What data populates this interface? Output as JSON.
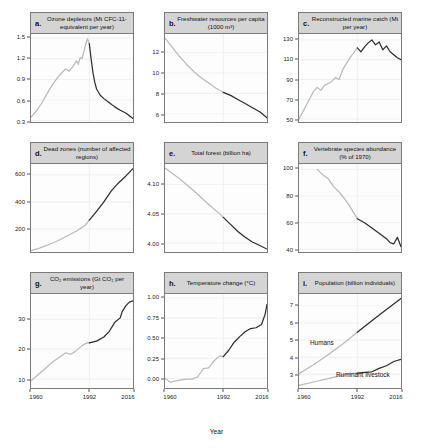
{
  "figure": {
    "xlabel": "Year",
    "xticks": [
      "1960",
      "1992",
      "2016"
    ],
    "colors": {
      "early": "#b9b9b9",
      "late": "#2b2b2b",
      "strip": "#d4d4d4",
      "grid": "#ececec"
    }
  },
  "chart_data": [
    {
      "type": "line",
      "letter": "a.",
      "title": "Ozone depletors (Mt CFC-11-equivalent per year)",
      "xlabel": "Year",
      "ylabel": "",
      "xlim": [
        1960,
        2016
      ],
      "ylim": [
        0.28,
        1.56
      ],
      "yticks": [
        1.5,
        1.2,
        0.9,
        0.6,
        0.3
      ],
      "ytick_labels": [
        "1.5",
        "1.2",
        "0.9",
        "0.6",
        "0.3"
      ],
      "grid": true,
      "legend": "none",
      "split_year": 1992,
      "series": [
        {
          "name": "Ozone depletors",
          "x": [
            1960,
            1963,
            1966,
            1969,
            1972,
            1975,
            1977,
            1979,
            1981,
            1983,
            1985,
            1986,
            1987,
            1988,
            1989,
            1990,
            1991,
            1992,
            1993,
            1994,
            1995,
            1996,
            1998,
            2000,
            2003,
            2006,
            2009,
            2012,
            2014,
            2016
          ],
          "values": [
            0.35,
            0.44,
            0.56,
            0.7,
            0.83,
            0.94,
            1.0,
            1.05,
            1.02,
            1.09,
            1.17,
            1.12,
            1.22,
            1.2,
            1.3,
            1.41,
            1.49,
            1.42,
            1.2,
            1.0,
            0.86,
            0.76,
            0.67,
            0.62,
            0.56,
            0.5,
            0.45,
            0.41,
            0.37,
            0.33
          ]
        }
      ]
    },
    {
      "type": "line",
      "letter": "b.",
      "title": "Freshwater resources per capita (1000 m³)",
      "xlabel": "Year",
      "ylabel": "",
      "xlim": [
        1960,
        2016
      ],
      "ylim": [
        5.2,
        13.8
      ],
      "yticks": [
        12,
        10,
        8,
        6
      ],
      "ytick_labels": [
        "12",
        "10",
        "8",
        "6"
      ],
      "grid": true,
      "legend": "none",
      "split_year": 1992,
      "series": [
        {
          "name": "Freshwater per capita",
          "x": [
            1960,
            1964,
            1968,
            1972,
            1976,
            1980,
            1984,
            1988,
            1992,
            1996,
            2000,
            2004,
            2008,
            2012,
            2016
          ],
          "values": [
            13.4,
            12.5,
            11.6,
            10.8,
            10.1,
            9.5,
            9.0,
            8.5,
            8.1,
            7.8,
            7.4,
            7.0,
            6.6,
            6.2,
            5.6
          ]
        }
      ]
    },
    {
      "type": "line",
      "letter": "c.",
      "title": "Reconstructed marine catch (Mt per year)",
      "xlabel": "Year",
      "ylabel": "",
      "xlim": [
        1960,
        2016
      ],
      "ylim": [
        47,
        136
      ],
      "yticks": [
        130,
        110,
        90,
        70,
        50
      ],
      "ytick_labels": [
        "130",
        "110",
        "90",
        "70",
        "50"
      ],
      "grid": true,
      "legend": "none",
      "split_year": 1992,
      "series": [
        {
          "name": "Marine catch",
          "x": [
            1960,
            1962,
            1964,
            1966,
            1968,
            1970,
            1972,
            1974,
            1976,
            1978,
            1980,
            1982,
            1984,
            1986,
            1988,
            1990,
            1992,
            1994,
            1996,
            1998,
            2000,
            2002,
            2004,
            2006,
            2008,
            2010,
            2012,
            2014,
            2016
          ],
          "values": [
            50,
            57,
            64,
            71,
            78,
            82,
            79,
            84,
            86,
            88,
            92,
            90,
            100,
            106,
            112,
            117,
            122,
            118,
            123,
            127,
            130,
            125,
            128,
            120,
            124,
            118,
            115,
            112,
            110
          ]
        }
      ]
    },
    {
      "type": "line",
      "letter": "d.",
      "title": "Dead zones (number of affected regions)",
      "xlabel": "Year",
      "ylabel": "",
      "xlim": [
        1960,
        2016
      ],
      "ylim": [
        30,
        680
      ],
      "yticks": [
        600,
        400,
        200
      ],
      "ytick_labels": [
        "600",
        "400",
        "200"
      ],
      "grid": true,
      "legend": "none",
      "split_year": 1992,
      "series": [
        {
          "name": "Dead zones",
          "x": [
            1960,
            1965,
            1970,
            1975,
            1980,
            1985,
            1990,
            1992,
            1996,
            2000,
            2004,
            2008,
            2012,
            2016
          ],
          "values": [
            40,
            60,
            85,
            115,
            150,
            185,
            230,
            265,
            330,
            400,
            480,
            540,
            590,
            645
          ]
        }
      ]
    },
    {
      "type": "line",
      "letter": "e.",
      "title": "Total forest (billion ha)",
      "xlabel": "Year",
      "ylabel": "",
      "xlim": [
        1960,
        2016
      ],
      "ylim": [
        3.985,
        4.135
      ],
      "yticks": [
        4.1,
        4.05,
        4.0
      ],
      "ytick_labels": [
        "4.10",
        "4.05",
        "4.00"
      ],
      "grid": true,
      "legend": "none",
      "split_year": 1992,
      "series": [
        {
          "name": "Total forest",
          "x": [
            1960,
            1968,
            1976,
            1984,
            1990,
            1992,
            1996,
            2000,
            2004,
            2008,
            2012,
            2016
          ],
          "values": [
            4.128,
            4.11,
            4.089,
            4.066,
            4.05,
            4.044,
            4.032,
            4.02,
            4.01,
            4.002,
            3.996,
            3.99
          ]
        }
      ]
    },
    {
      "type": "line",
      "letter": "f.",
      "title": "Vertebrate species abundance (% of 1970)",
      "xlabel": "Year",
      "ylabel": "",
      "xlim": [
        1960,
        2016
      ],
      "ylim": [
        38,
        104
      ],
      "yticks": [
        100,
        80,
        60,
        40
      ],
      "ytick_labels": [
        "100",
        "80",
        "60",
        "40"
      ],
      "grid": true,
      "legend": "none",
      "split_year": 1992,
      "series": [
        {
          "name": "Vertebrate abundance",
          "x": [
            1970,
            1973,
            1976,
            1979,
            1982,
            1985,
            1988,
            1992,
            1996,
            2000,
            2004,
            2008,
            2010,
            2012,
            2014,
            2016
          ],
          "values": [
            100,
            96,
            93,
            87,
            83,
            78,
            72,
            63,
            60,
            56,
            52,
            48,
            45,
            44,
            49,
            42
          ]
        }
      ]
    },
    {
      "type": "line",
      "letter": "g.",
      "title": "CO₂ emissions (Gt CO₂ per year)",
      "xlabel": "Year",
      "ylabel": "",
      "xlim": [
        1960,
        2016
      ],
      "ylim": [
        7,
        38.5
      ],
      "yticks": [
        30,
        20,
        10
      ],
      "ytick_labels": [
        "30",
        "20",
        "10"
      ],
      "grid": true,
      "legend": "none",
      "split_year": 1992,
      "series": [
        {
          "name": "CO2 emissions",
          "x": [
            1960,
            1964,
            1968,
            1972,
            1976,
            1979,
            1982,
            1985,
            1988,
            1991,
            1992,
            1996,
            2000,
            2003,
            2006,
            2009,
            2010,
            2012,
            2014,
            2016
          ],
          "values": [
            9.4,
            11.5,
            13.6,
            15.8,
            17.5,
            18.8,
            18.3,
            19.6,
            21.2,
            22.2,
            22.1,
            22.7,
            24.1,
            26.0,
            29.0,
            30.5,
            32.5,
            34.5,
            35.8,
            36.2
          ]
        }
      ]
    },
    {
      "type": "line",
      "letter": "h.",
      "title": "Temperature change (°C)",
      "xlabel": "Year",
      "ylabel": "",
      "xlim": [
        1960,
        2016
      ],
      "ylim": [
        -0.12,
        1.05
      ],
      "yticks": [
        1.0,
        0.75,
        0.5,
        0.25,
        0.0
      ],
      "ytick_labels": [
        "1.00",
        "0.75",
        "0.50",
        "0.25",
        "0.00"
      ],
      "grid": true,
      "legend": "none",
      "split_year": 1992,
      "series": [
        {
          "name": "Temperature change",
          "x": [
            1960,
            1963,
            1966,
            1969,
            1972,
            1975,
            1978,
            1981,
            1984,
            1987,
            1990,
            1992,
            1995,
            1998,
            2001,
            2004,
            2007,
            2010,
            2013,
            2015,
            2016
          ],
          "values": [
            0.0,
            -0.05,
            -0.03,
            -0.02,
            -0.01,
            -0.01,
            0.02,
            0.12,
            0.13,
            0.22,
            0.28,
            0.27,
            0.35,
            0.45,
            0.52,
            0.58,
            0.62,
            0.63,
            0.67,
            0.8,
            0.92
          ]
        }
      ]
    },
    {
      "type": "line",
      "letter": "i.",
      "title": "Population (billion individuals)",
      "xlabel": "Year",
      "ylabel": "",
      "xlim": [
        1960,
        2016
      ],
      "ylim": [
        2.2,
        7.7
      ],
      "yticks": [
        7,
        6,
        5,
        4,
        3
      ],
      "ytick_labels": [
        "7",
        "6",
        "5",
        "4",
        "3"
      ],
      "grid": true,
      "legend": "inline",
      "split_year": 1992,
      "series": [
        {
          "name": "Humans",
          "label": "Humans",
          "x": [
            1960,
            1968,
            1976,
            1984,
            1992,
            2000,
            2008,
            2016
          ],
          "values": [
            3.03,
            3.56,
            4.15,
            4.78,
            5.46,
            6.14,
            6.79,
            7.44
          ]
        },
        {
          "name": "Ruminant livestock",
          "label": "Ruminant livestock",
          "x": [
            1960,
            1968,
            1976,
            1984,
            1990,
            1992,
            1996,
            2000,
            2004,
            2008,
            2012,
            2016
          ],
          "values": [
            2.35,
            2.55,
            2.75,
            2.95,
            3.05,
            3.07,
            3.12,
            3.15,
            3.35,
            3.5,
            3.75,
            3.88
          ]
        }
      ]
    }
  ]
}
